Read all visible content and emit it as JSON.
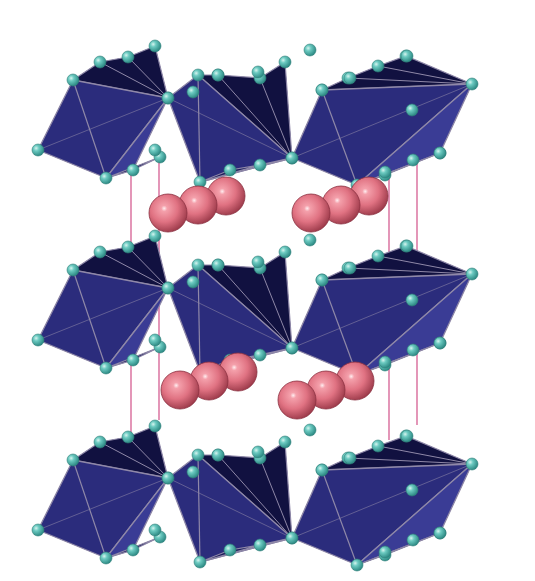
{
  "figure": {
    "description": "Layered perovskite crystal structure: three slabs of corner-sharing dark-blue octahedra separated by pairs of pink cations, with thin magenta unit-cell lines",
    "colors": {
      "background": "#ffffff",
      "octahedron_fill": "#2b2c7c",
      "octahedron_dark": "#15164a",
      "octahedron_light": "#3a3c95",
      "octahedron_edge": "#8f88a8",
      "anion_sphere": "#5fc2b9",
      "anion_sphere_highlight": "#c9f0ea",
      "cation_sphere": "#e07282",
      "cation_sphere_highlight": "#ffe4e8",
      "cell_line": "#d86a9a"
    },
    "layers": [
      {
        "name": "top-slab",
        "dy": 0
      },
      {
        "name": "middle-slab",
        "dy": 190
      },
      {
        "name": "bottom-slab",
        "dy": 380
      }
    ],
    "cation_groups": [
      {
        "name": "cation-row-upper-left",
        "atoms": [
          [
            168,
            213
          ],
          [
            198,
            205
          ],
          [
            226,
            196
          ]
        ]
      },
      {
        "name": "cation-row-upper-right",
        "atoms": [
          [
            311,
            213
          ],
          [
            341,
            205
          ],
          [
            369,
            196
          ]
        ]
      },
      {
        "name": "cation-row-lower-left",
        "atoms": [
          [
            180,
            390
          ],
          [
            209,
            381
          ],
          [
            238,
            372
          ]
        ]
      },
      {
        "name": "cation-row-lower-right",
        "atoms": [
          [
            297,
            400
          ],
          [
            326,
            390
          ],
          [
            355,
            381
          ]
        ]
      }
    ],
    "cell_lines": [
      [
        131,
        175,
        131,
        445
      ],
      [
        159,
        158,
        159,
        420
      ],
      [
        389,
        168,
        389,
        440
      ],
      [
        417,
        158,
        417,
        425
      ]
    ]
  }
}
